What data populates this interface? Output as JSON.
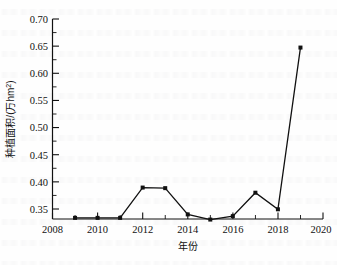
{
  "chart_data": {
    "type": "line",
    "title": "",
    "xlabel": "年份",
    "ylabel": "种植面积/(万hm²)",
    "ylabel_main": "种植面积/(万hm",
    "ylabel_sup": "2",
    "ylabel_tail": ")",
    "xlim": [
      2008,
      2020
    ],
    "ylim": [
      0.35,
      0.7
    ],
    "grid": false,
    "legend": "none",
    "x_ticks": [
      "2008",
      "2010",
      "2012",
      "2014",
      "2016",
      "2018",
      "2020"
    ],
    "x_tick_values": [
      2008,
      2010,
      2012,
      2014,
      2016,
      2018,
      2020
    ],
    "y_ticks": [
      "0.35",
      "0.40",
      "0.45",
      "0.50",
      "0.55",
      "0.60",
      "0.65",
      "0.70"
    ],
    "y_tick_values": [
      0.35,
      0.4,
      0.45,
      0.5,
      0.55,
      0.6,
      0.65,
      0.7
    ],
    "x": [
      2009,
      2010,
      2011,
      2012,
      2013,
      2014,
      2015,
      2016,
      2017,
      2018,
      2019
    ],
    "values": [
      0.352,
      0.352,
      0.352,
      0.405,
      0.404,
      0.358,
      0.349,
      0.355,
      0.396,
      0.367,
      0.65
    ],
    "series": [
      {
        "name": "种植面积",
        "marker": "filled-square",
        "color": "#111111",
        "line_color": "#111111",
        "values": [
          0.352,
          0.352,
          0.352,
          0.405,
          0.404,
          0.358,
          0.349,
          0.355,
          0.396,
          0.367,
          0.65
        ]
      }
    ]
  },
  "style": {
    "axis_color": "#111111",
    "marker_color": "#111111",
    "background": "#fefefe"
  }
}
